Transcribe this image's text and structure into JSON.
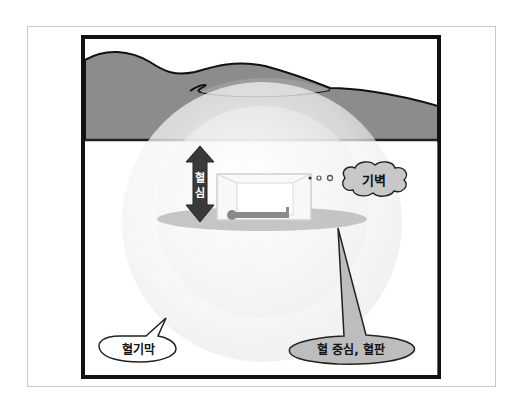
{
  "diagram": {
    "labels": {
      "vertical_arrow": [
        "혈",
        "심"
      ],
      "cloud": "기벽",
      "membrane": "혈기막",
      "center": "혈 중심, 혈판"
    },
    "colors": {
      "ground": "#8c8c8c",
      "ground_light": "#a8a8a8",
      "frame": "#111111",
      "sphere": "#f4f4f4",
      "arrow": "#3a3a3a",
      "callout_fill": "#bdbdbd",
      "cloud_fill": "#c4c4c4"
    }
  }
}
